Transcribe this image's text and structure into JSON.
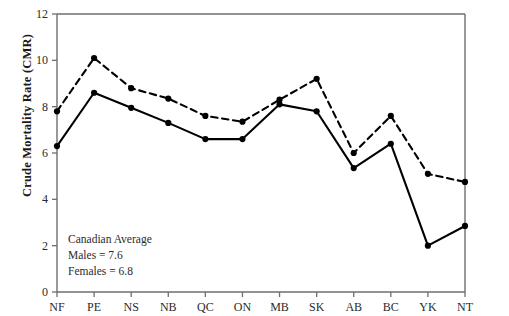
{
  "chart_data": {
    "type": "line",
    "title": "",
    "xlabel": "",
    "ylabel": "Crude Mortality Rate (CMR)",
    "categories": [
      "NF",
      "PE",
      "NS",
      "NB",
      "QC",
      "ON",
      "MB",
      "SK",
      "AB",
      "BC",
      "YK",
      "NT"
    ],
    "ylim": [
      0,
      12
    ],
    "yticks": [
      0,
      2,
      4,
      6,
      8,
      10,
      12
    ],
    "ytick_labels": [
      "0",
      "2",
      "4",
      "6",
      "8",
      "10",
      "12"
    ],
    "grid": false,
    "legend": "none",
    "series": [
      {
        "name": "Males",
        "style": "dashed",
        "marker": "filled-circle",
        "color": "#000000",
        "values": [
          7.8,
          10.1,
          8.8,
          8.35,
          7.6,
          7.35,
          8.3,
          9.2,
          6.0,
          7.6,
          5.1,
          4.75
        ]
      },
      {
        "name": "Females",
        "style": "solid",
        "marker": "filled-circle",
        "color": "#000000",
        "values": [
          6.3,
          8.6,
          7.95,
          7.3,
          6.6,
          6.6,
          8.1,
          7.8,
          5.35,
          6.4,
          2.0,
          2.85
        ]
      }
    ],
    "annotation": {
      "line1": "Canadian Average",
      "line2": "Males = 7.6",
      "line3": "Females = 6.8"
    }
  }
}
